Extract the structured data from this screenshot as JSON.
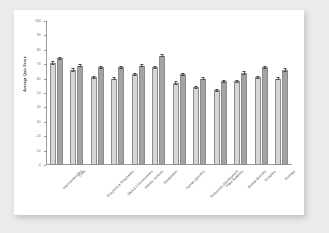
{
  "chart_data": {
    "type": "bar",
    "title": "",
    "xlabel": "",
    "ylabel": "Average Quiz Score",
    "ylim": [
      0,
      100
    ],
    "ytick_labels": [
      "100",
      "90",
      "80",
      "70",
      "60",
      "50",
      "40",
      "30",
      "20",
      "10",
      "0"
    ],
    "ytick_values": [
      100,
      90,
      80,
      70,
      60,
      50,
      40,
      30,
      20,
      10,
      0
    ],
    "grid": false,
    "legend": "none",
    "orientation": "vertical",
    "error_bars": true,
    "categories": [
      "Macromolecules",
      "Cells",
      "Enzymes & Respiration",
      "DNA & Chromosomes",
      "Mitosis, meiosis",
      "Metabolism",
      "Human genetics",
      "Embryonic development",
      "Plant Anatomy",
      "Animal diversity",
      "Evolution",
      "Ecology"
    ],
    "series": [
      {
        "name": "Series 1",
        "color": "#d6d6d6",
        "values": [
          71,
          66,
          61,
          60,
          63,
          68,
          57,
          54,
          52,
          58,
          61,
          60
        ]
      },
      {
        "name": "Series 2",
        "color": "#a3a3a3",
        "values": [
          74,
          69,
          68,
          68,
          69,
          76,
          63,
          60,
          58,
          64,
          68,
          66
        ]
      }
    ]
  },
  "colors": {
    "page_background": "#eceaea",
    "card_background": "#ffffff",
    "axis": "#9a9a9a",
    "tick_text": "#6d6d6d",
    "label_text": "#4a4a4a",
    "series_1": "#d6d6d6",
    "series_2": "#a3a3a3",
    "error_bar": "#4a4a4a"
  }
}
